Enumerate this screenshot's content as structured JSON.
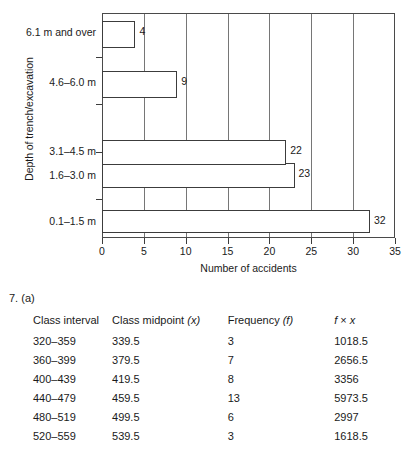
{
  "chart_data": {
    "type": "bar",
    "orientation": "horizontal",
    "title": "",
    "xlabel": "Number of accidents",
    "ylabel": "Depth of trench/excavation",
    "categories": [
      "0.1–1.5 m",
      "1.6–3.0 m",
      "3.1–4.5 m",
      "4.6–6.0 m",
      "6.1 m and over"
    ],
    "values": [
      32,
      23,
      22,
      9,
      4
    ],
    "data_labels": [
      "32",
      "23",
      "22",
      "9",
      "4"
    ],
    "xlim": [
      0,
      35
    ],
    "xticks": [
      0,
      5,
      10,
      15,
      20,
      25,
      30,
      35
    ],
    "xtick_labels": [
      "0",
      "5",
      "10",
      "15",
      "20",
      "25",
      "30",
      "35"
    ],
    "grid": "vertical",
    "legend": "none",
    "bar_fill": "#ffffff",
    "bar_stroke": "#3c3c3c"
  },
  "answer": {
    "question_number": "7. (a)",
    "table": {
      "headers": {
        "interval": "Class interval",
        "midpoint_text": "Class midpoint ",
        "midpoint_var": "(x)",
        "frequency_text": "Frequency ",
        "frequency_var": "(f)",
        "fx_var1": "f",
        "fx_op": " × ",
        "fx_var2": "x"
      },
      "rows": [
        {
          "interval": "320–359",
          "midpoint": "339.5",
          "frequency": "3",
          "fx": "1018.5"
        },
        {
          "interval": "360–399",
          "midpoint": "379.5",
          "frequency": "7",
          "fx": "2656.5"
        },
        {
          "interval": "400–439",
          "midpoint": "419.5",
          "frequency": "8",
          "fx": "3356"
        },
        {
          "interval": "440–479",
          "midpoint": "459.5",
          "frequency": "13",
          "fx": "5973.5"
        },
        {
          "interval": "480–519",
          "midpoint": "499.5",
          "frequency": "6",
          "fx": "2997"
        },
        {
          "interval": "520–559",
          "midpoint": "539.5",
          "frequency": "3",
          "fx": "1618.5"
        }
      ]
    }
  }
}
